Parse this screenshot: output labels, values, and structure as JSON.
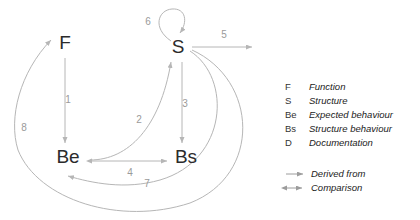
{
  "diagram": {
    "colors": {
      "line": "#b6b6b6",
      "node_text": "#2b2b2b",
      "number_text": "#9a9a9a",
      "legend_text": "#222222",
      "background": "#ffffff"
    },
    "nodes": [
      {
        "id": "F",
        "label": "F",
        "x": 65,
        "y": 44
      },
      {
        "id": "S",
        "label": "S",
        "x": 178,
        "y": 48
      },
      {
        "id": "Be",
        "label": "Be",
        "x": 68,
        "y": 158
      },
      {
        "id": "Bs",
        "label": "Bs",
        "x": 186,
        "y": 158
      }
    ],
    "edges": [
      {
        "number": "1",
        "from": "F",
        "to": "Be",
        "kind": "derived-from",
        "label_x": 68,
        "label_y": 100
      },
      {
        "number": "2",
        "from": "Be",
        "to": "S",
        "kind": "derived-from",
        "label_x": 139,
        "label_y": 120
      },
      {
        "number": "3",
        "from": "S",
        "to": "Bs",
        "kind": "derived-from",
        "label_x": 182,
        "label_y": 104
      },
      {
        "number": "4",
        "from": "Be",
        "to": "Bs",
        "kind": "comparison",
        "label_x": 130,
        "label_y": 172
      },
      {
        "number": "5",
        "from": "S",
        "to": "D",
        "kind": "derived-from",
        "label_x": 224,
        "label_y": 35
      },
      {
        "number": "6",
        "from": "S",
        "to": "S",
        "kind": "derived-from",
        "label_x": 148,
        "label_y": 22
      },
      {
        "number": "7",
        "from": "S",
        "to": "Be",
        "kind": "derived-from",
        "label_x": 147,
        "label_y": 183
      },
      {
        "number": "8",
        "from": "S",
        "to": "F",
        "kind": "derived-from",
        "label_x": 24,
        "label_y": 128
      }
    ],
    "legend": {
      "abbreviations": [
        {
          "key": "F",
          "description": "Function"
        },
        {
          "key": "S",
          "description": "Structure"
        },
        {
          "key": "Be",
          "description": "Expected behaviour"
        },
        {
          "key": "Bs",
          "description": "Structure behaviour"
        },
        {
          "key": "D",
          "description": "Documentation"
        }
      ],
      "relations": [
        {
          "symbol": "single-arrow",
          "description": "Derived from"
        },
        {
          "symbol": "double-arrow",
          "description": "Comparison"
        }
      ]
    }
  }
}
